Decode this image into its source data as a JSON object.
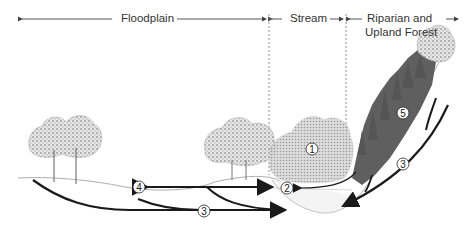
{
  "zones": {
    "floodplain": {
      "label": "Floodplain"
    },
    "stream": {
      "label": "Stream"
    },
    "riparian": {
      "label_line1": "Riparian and",
      "label_line2": "Upland Forest"
    }
  },
  "markers": [
    {
      "id": "1",
      "label": "1",
      "meaning": "stream-bank vegetation"
    },
    {
      "id": "2",
      "label": "2",
      "meaning": "stream channel"
    },
    {
      "id": "3",
      "label": "3",
      "meaning": "subsurface flow path"
    },
    {
      "id": "4",
      "label": "4",
      "meaning": "floodplain wetland"
    },
    {
      "id": "5",
      "label": "5",
      "meaning": "upland forest slope"
    }
  ],
  "colors": {
    "line": "#1a1a1a",
    "text": "#333333",
    "forest": "#5a5a5a",
    "foliage": "#b8b8b8",
    "dashed": "#777777"
  }
}
